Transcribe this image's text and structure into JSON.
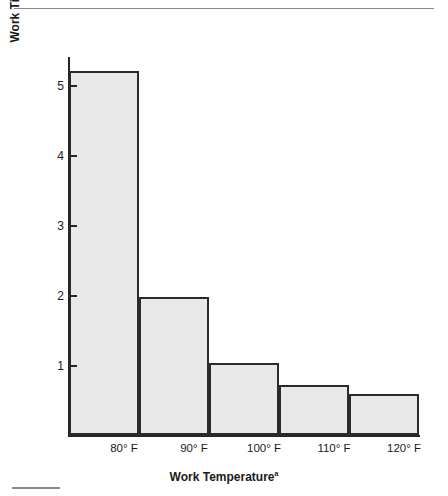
{
  "figure": {
    "y_axis_title_line1": "Work Time Before Performance Begins to Decline",
    "y_axis_title_line2": "(in Hours)",
    "x_axis_title": "Work Temperature",
    "x_axis_title_footnote": "a"
  },
  "chart_data": {
    "type": "bar",
    "title": "",
    "xlabel": "Work Temperature",
    "ylabel": "Work Time Before Performance Begins to Decline (in Hours)",
    "categories": [
      "80° F",
      "90° F",
      "100° F",
      "110° F",
      "120° F"
    ],
    "values": [
      5.2,
      1.97,
      1.03,
      0.71,
      0.59
    ],
    "ytick_labels": [
      "1",
      "2",
      "3",
      "4",
      "5"
    ],
    "ytick_values": [
      1,
      2,
      3,
      4,
      5
    ],
    "ylim": [
      0,
      5.45
    ],
    "grid": false,
    "legend": false,
    "bar_fill_color": "#e9e9e9",
    "bar_edge_color": "#2b2b2b",
    "axis_color": "#262626"
  }
}
